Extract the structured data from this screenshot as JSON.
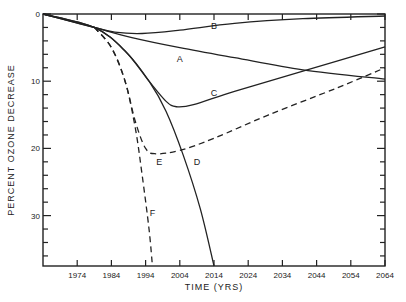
{
  "chart_data": {
    "type": "line",
    "title": "",
    "xlabel": "TIME (YRS)",
    "ylabel": "PERCENT OZONE DECREASE",
    "xlim": [
      1964,
      2064
    ],
    "ylim": [
      0,
      37.5
    ],
    "y_inverted": true,
    "grid": false,
    "legend": "inline curve labels",
    "x_ticks": [
      1974,
      1984,
      1994,
      2004,
      2014,
      2024,
      2034,
      2044,
      2054,
      2064
    ],
    "y_ticks": [
      0,
      10,
      20,
      30
    ],
    "series": [
      {
        "name": "A",
        "style": "solid",
        "label_pos": [
          2004,
          7.2
        ],
        "x": [
          1964,
          1970,
          1979,
          1990,
          2004,
          2020,
          2040,
          2064
        ],
        "y": [
          0,
          0.8,
          2.0,
          3.5,
          5.0,
          6.5,
          8.3,
          9.7
        ]
      },
      {
        "name": "B",
        "style": "solid",
        "label_pos": [
          2014,
          2.2
        ],
        "x": [
          1964,
          1970,
          1979,
          1985,
          1993,
          2004,
          2020,
          2040,
          2064
        ],
        "y": [
          0,
          0.8,
          2.0,
          2.7,
          2.9,
          2.4,
          1.4,
          0.7,
          0.3
        ]
      },
      {
        "name": "C",
        "style": "solid",
        "label_pos": [
          2014,
          12.2
        ],
        "x": [
          1964,
          1979,
          1988,
          1995,
          2000,
          2003,
          2008,
          2020,
          2040,
          2064
        ],
        "y": [
          0,
          2.0,
          5.5,
          10.0,
          13.0,
          13.8,
          13.5,
          11.5,
          8.5,
          4.9
        ]
      },
      {
        "name": "D",
        "style": "solid",
        "label_pos": [
          2009,
          22.5
        ],
        "x": [
          1964,
          1979,
          1988,
          1995,
          2000,
          2005,
          2010,
          2014
        ],
        "y": [
          0,
          2.0,
          5.5,
          10.0,
          14.5,
          21.0,
          29.0,
          37.5
        ]
      },
      {
        "name": "E",
        "style": "dashed",
        "label_pos": [
          1998,
          22.5
        ],
        "x": [
          1979,
          1984,
          1988,
          1991,
          1994,
          1997,
          2004,
          2014,
          2030,
          2050,
          2064
        ],
        "y": [
          2.0,
          5.0,
          10.0,
          16.0,
          20.0,
          20.8,
          20.3,
          18.5,
          15.0,
          11.0,
          8.0
        ]
      },
      {
        "name": "F",
        "style": "dashed",
        "label_pos": [
          1996,
          30.0
        ],
        "x": [
          1979,
          1984,
          1988,
          1991,
          1993,
          1995,
          1996
        ],
        "y": [
          2.0,
          5.0,
          10.0,
          17.0,
          24.0,
          32.0,
          37.5
        ]
      }
    ]
  },
  "axes": {
    "x_title": "TIME (YRS)",
    "y_title": "PERCENT OZONE DECREASE"
  }
}
